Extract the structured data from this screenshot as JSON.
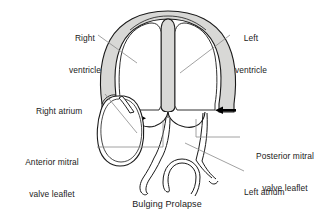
{
  "figure": {
    "caption": "Bulging Prolapse",
    "title": "Bulging Prolapse",
    "type": "anatomical-line-diagram"
  },
  "labels": [
    {
      "id": "right-ventricle",
      "text": "Right\nventricle",
      "line1": "Right",
      "line2": "ventricle"
    },
    {
      "id": "left-ventricle",
      "text": "Left\nventricle",
      "line1": "Left",
      "line2": "ventricle"
    },
    {
      "id": "right-atrium",
      "text": "Right atrium",
      "line1": "Right atrium",
      "line2": ""
    },
    {
      "id": "anterior-leaflet",
      "text": "Anterior mitral\nvalve leaflet",
      "line1": "Anterior mitral",
      "line2": "valve leaflet"
    },
    {
      "id": "posterior-leaflet",
      "text": "Posterior mitral\nvalve leaflet",
      "line1": "Posterior mitral",
      "line2": "valve leaflet"
    },
    {
      "id": "left-atrium",
      "text": "Left atrium",
      "line1": "Left atrium",
      "line2": ""
    }
  ],
  "annotations": {
    "arrow_left_label": "inward-force-arrow-left",
    "arrow_right_label": "inward-force-arrow-right",
    "arrow_count": 2
  },
  "colors": {
    "background": "#ffffff",
    "stroke": "#1a1a1a",
    "myocardium_fill": "#d8d8d6",
    "chamber_fill": "#ffffff",
    "leader_line": "#7a7a7a",
    "text": "#1a1a1a"
  }
}
